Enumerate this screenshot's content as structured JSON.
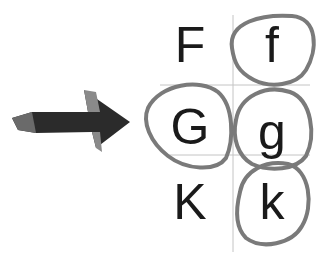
{
  "figure": {
    "letters": [
      {
        "char": "F",
        "x": 190,
        "y": 45,
        "circled": false
      },
      {
        "char": "f",
        "x": 272,
        "y": 45,
        "circled": true
      },
      {
        "char": "G",
        "x": 190,
        "y": 127,
        "circled": true
      },
      {
        "char": "g",
        "x": 272,
        "y": 132,
        "circled": true
      },
      {
        "char": "K",
        "x": 190,
        "y": 202,
        "circled": false
      },
      {
        "char": "k",
        "x": 272,
        "y": 202,
        "circled": true
      }
    ],
    "arrow": {
      "direction": "right",
      "color": "#2b2b2b"
    },
    "circle_color": "#7a7a7a",
    "gridline_color": "#bdbdbd"
  }
}
